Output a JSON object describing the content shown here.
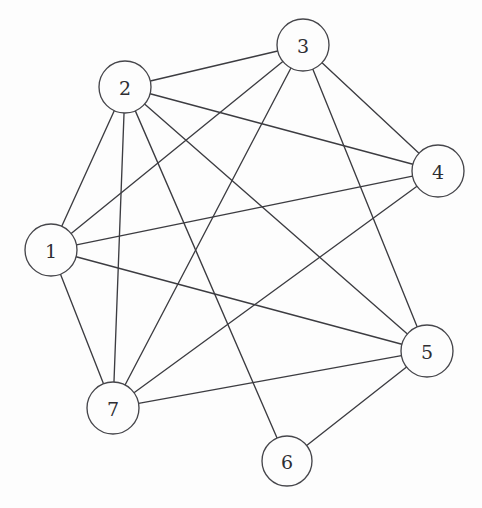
{
  "diagram": {
    "type": "node-link-graph",
    "background_color": "#fdfdfd",
    "node_fill_color": "#fdfdfd",
    "node_stroke_color": "#46464b",
    "edge_color": "#3c3c41",
    "label_color": "#2e2e33",
    "node_radius": 26,
    "nodes": [
      {
        "id": "1",
        "label": "1",
        "x": 51,
        "y": 250,
        "r": 26
      },
      {
        "id": "2",
        "label": "2",
        "x": 125,
        "y": 87,
        "r": 26
      },
      {
        "id": "3",
        "label": "3",
        "x": 303,
        "y": 45,
        "r": 26
      },
      {
        "id": "4",
        "label": "4",
        "x": 438,
        "y": 171,
        "r": 26
      },
      {
        "id": "5",
        "label": "5",
        "x": 427,
        "y": 351,
        "r": 26
      },
      {
        "id": "6",
        "label": "6",
        "x": 287,
        "y": 461,
        "r": 25
      },
      {
        "id": "7",
        "label": "7",
        "x": 113,
        "y": 408,
        "r": 26
      }
    ],
    "edges": [
      {
        "source": "1",
        "target": "2"
      },
      {
        "source": "1",
        "target": "3"
      },
      {
        "source": "1",
        "target": "4"
      },
      {
        "source": "1",
        "target": "5"
      },
      {
        "source": "1",
        "target": "7"
      },
      {
        "source": "2",
        "target": "3"
      },
      {
        "source": "2",
        "target": "4"
      },
      {
        "source": "2",
        "target": "5"
      },
      {
        "source": "2",
        "target": "6"
      },
      {
        "source": "2",
        "target": "7"
      },
      {
        "source": "3",
        "target": "4"
      },
      {
        "source": "3",
        "target": "5"
      },
      {
        "source": "3",
        "target": "7"
      },
      {
        "source": "4",
        "target": "7"
      },
      {
        "source": "5",
        "target": "6"
      },
      {
        "source": "5",
        "target": "7"
      }
    ]
  }
}
